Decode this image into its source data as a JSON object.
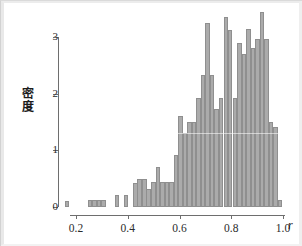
{
  "figure": {
    "background_color": "#ffffff",
    "bar_fill_color": "#ababab",
    "bar_edge_color": "#8f8f8f",
    "axis_color": "#6e6e6e"
  },
  "axes": {
    "y_title": "密度",
    "x_title": "r",
    "y_ticks": [
      "0",
      "1",
      "2",
      "3"
    ],
    "x_ticks": [
      "0.2",
      "0.4",
      "0.6",
      "0.8",
      "1.0"
    ]
  },
  "chart_data": {
    "type": "bar",
    "title": "",
    "subtitle": "",
    "xlabel": "r",
    "ylabel": "密度",
    "xlim": [
      0.13,
      1.0
    ],
    "ylim": [
      0,
      3.5
    ],
    "yticks": [
      0,
      1,
      2,
      3
    ],
    "xticks": [
      0.2,
      0.4,
      0.6,
      0.8,
      1.0
    ],
    "grid": false,
    "legend": null,
    "bin_width": 0.0175,
    "bin_centers": [
      0.166,
      0.184,
      0.201,
      0.219,
      0.236,
      0.254,
      0.271,
      0.289,
      0.306,
      0.324,
      0.341,
      0.359,
      0.376,
      0.394,
      0.411,
      0.429,
      0.446,
      0.464,
      0.481,
      0.499,
      0.516,
      0.534,
      0.551,
      0.569,
      0.586,
      0.604,
      0.621,
      0.639,
      0.656,
      0.674,
      0.691,
      0.709,
      0.726,
      0.744,
      0.761,
      0.779,
      0.796,
      0.814,
      0.831,
      0.849,
      0.866,
      0.884,
      0.901,
      0.919,
      0.936,
      0.954,
      0.971,
      0.989
    ],
    "values": [
      0.11,
      0.0,
      0.0,
      0.0,
      0.0,
      0.13,
      0.13,
      0.13,
      0.13,
      0.0,
      0.0,
      0.22,
      0.0,
      0.22,
      0.0,
      0.42,
      0.5,
      0.5,
      0.31,
      0.44,
      0.71,
      0.44,
      0.44,
      0.44,
      0.91,
      1.6,
      1.31,
      1.5,
      1.5,
      1.93,
      2.33,
      3.25,
      2.33,
      1.73,
      1.92,
      3.36,
      3.12,
      1.92,
      2.9,
      2.7,
      3.15,
      2.8,
      2.97,
      3.45,
      2.97,
      1.5,
      1.41,
      0.13
    ]
  }
}
